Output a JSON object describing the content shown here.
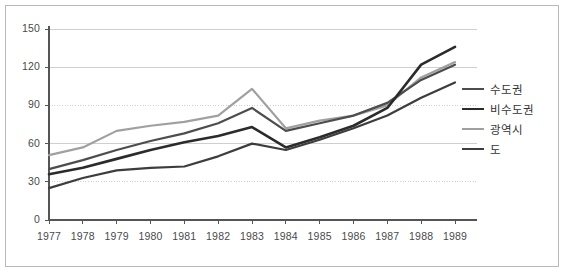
{
  "chart_data": {
    "type": "line",
    "title": "",
    "xlabel": "",
    "ylabel": "",
    "x": [
      1977,
      1978,
      1979,
      1980,
      1981,
      1982,
      1983,
      1984,
      1985,
      1986,
      1987,
      1988,
      1989
    ],
    "categories": [
      "1977",
      "1978",
      "1979",
      "1980",
      "1981",
      "1982",
      "1983",
      "1984",
      "1985",
      "1986",
      "1987",
      "1988",
      "1989"
    ],
    "xlim": [
      1977,
      1989
    ],
    "ylim": [
      0,
      150
    ],
    "yticks": [
      0,
      30,
      60,
      90,
      120,
      150
    ],
    "grid": true,
    "legend_position": "right",
    "series": [
      {
        "name": "수도권",
        "color": "#4d4d4d",
        "width": 2.2,
        "values": [
          40,
          47,
          55,
          62,
          68,
          76,
          88,
          70,
          76,
          82,
          92,
          110,
          122
        ]
      },
      {
        "name": "비수도권",
        "color": "#2b2b2b",
        "width": 2.6,
        "values": [
          36,
          41,
          48,
          55,
          61,
          66,
          73,
          57,
          65,
          74,
          88,
          122,
          136
        ]
      },
      {
        "name": "광역시",
        "color": "#a0a0a0",
        "width": 2.2,
        "values": [
          51,
          57,
          70,
          74,
          77,
          82,
          103,
          72,
          78,
          82,
          90,
          112,
          124
        ]
      },
      {
        "name": "도",
        "color": "#3d3d3d",
        "width": 2.2,
        "values": [
          25,
          33,
          39,
          41,
          42,
          50,
          60,
          55,
          63,
          72,
          82,
          96,
          108
        ]
      }
    ]
  },
  "axes": {
    "ytick_labels": [
      "150",
      "120",
      "90",
      "60",
      "30",
      "0"
    ],
    "xtick_labels": [
      "1977",
      "1978",
      "1979",
      "1980",
      "1981",
      "1982",
      "1983",
      "1984",
      "1985",
      "1986",
      "1987",
      "1988",
      "1989"
    ]
  },
  "legend": {
    "items": [
      {
        "label": "수도권",
        "color": "#4d4d4d",
        "width": "2.2px"
      },
      {
        "label": "비수도권",
        "color": "#2b2b2b",
        "width": "2.8px"
      },
      {
        "label": "광역시",
        "color": "#a0a0a0",
        "width": "2.2px"
      },
      {
        "label": "도",
        "color": "#3d3d3d",
        "width": "2.4px"
      }
    ]
  },
  "colors": {
    "frame": "#b9b9b9",
    "grid": "#cfcfcf",
    "axis": "#555555",
    "text": "#4a4a4a",
    "background": "#ffffff"
  }
}
